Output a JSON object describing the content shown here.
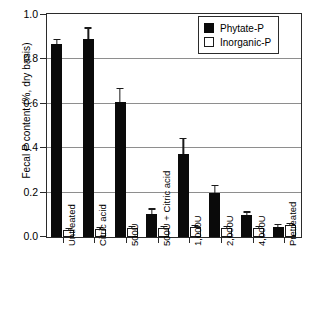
{
  "chart_data": {
    "type": "bar",
    "title": "",
    "xlabel": "",
    "ylabel": "Fecal P content (%, dry basis)",
    "ylim": [
      0,
      1.0
    ],
    "yticks": [
      "0.0",
      "0.2",
      "0.4",
      "0.6",
      "0.8",
      "1.0"
    ],
    "ytick_values": [
      0.0,
      0.2,
      0.4,
      0.6,
      0.8,
      1.0
    ],
    "grid": "horizontal",
    "legend_position": "top-right",
    "categories": [
      "Untreated",
      "Citric acid",
      "500U",
      "500U + Citric acid",
      "1,000U",
      "2,000U",
      "4,000U",
      "Pretreated"
    ],
    "series": [
      {
        "name": "Phytate-P",
        "color": "#0a0a0a",
        "values": [
          0.87,
          0.89,
          0.61,
          0.105,
          0.375,
          0.2,
          0.098,
          0.045
        ],
        "errors": [
          0.018,
          0.048,
          0.055,
          0.018,
          0.065,
          0.028,
          0.012,
          0.009
        ]
      },
      {
        "name": "Inorganic-P",
        "color": "#ffffff",
        "values": [
          0.033,
          0.037,
          0.042,
          0.04,
          0.046,
          0.041,
          0.04,
          0.055
        ],
        "errors": [
          0.004,
          0.004,
          0.004,
          0.004,
          0.004,
          0.004,
          0.004,
          0.004
        ]
      }
    ]
  },
  "legend": {
    "items": [
      {
        "label": "Phytate-P",
        "style": "filled"
      },
      {
        "label": "Inorganic-P",
        "style": "open"
      }
    ]
  }
}
